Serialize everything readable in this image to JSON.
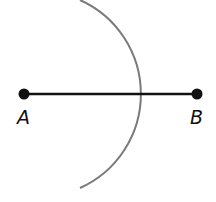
{
  "diagram": {
    "type": "geometric-construction",
    "colors": {
      "segment": "#111111",
      "points": "#111111",
      "arc": "#7a7a7a",
      "labels": "#111111"
    },
    "points": [
      {
        "label": "A",
        "x": 24,
        "y": 94
      },
      {
        "label": "B",
        "x": 197,
        "y": 94
      }
    ],
    "segment": {
      "from": "A",
      "to": "B"
    },
    "arc": {
      "center_x": 38,
      "center_y": 94,
      "radius": 103,
      "start": {
        "x": 80,
        "y": 0
      },
      "end": {
        "x": 80,
        "y": 188
      }
    }
  },
  "labels": {
    "point_a": "A",
    "point_b": "B"
  }
}
